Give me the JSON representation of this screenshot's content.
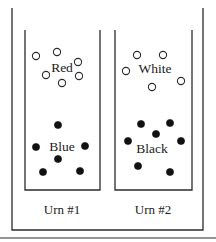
{
  "figure": {
    "outer_frame": {
      "x": 12,
      "y": 8,
      "width": 191,
      "height": 222,
      "open_top": true,
      "stroke": "#2b2b2b",
      "stroke_width": 1.3
    },
    "baseline_rule": {
      "x1": 0,
      "x2": 216,
      "y": 238,
      "stroke": "#2b2b2b",
      "stroke_width": 1.2
    },
    "urns": [
      {
        "id": "urn-1",
        "label": "Urn #1",
        "label_x": 62,
        "label_y": 214,
        "box": {
          "x": 25,
          "y": 30,
          "width": 75,
          "height": 160,
          "open_top": true
        },
        "groups": [
          {
            "id": "urn-1-red",
            "label": "Red",
            "label_x": 62,
            "label_y": 72,
            "ball_style": "open",
            "color_name": "Red",
            "count": 6,
            "balls": [
              {
                "cx": 36,
                "cy": 56,
                "r": 3.6
              },
              {
                "cx": 57,
                "cy": 52,
                "r": 3.6
              },
              {
                "cx": 78,
                "cy": 62,
                "r": 3.6
              },
              {
                "cx": 46,
                "cy": 75,
                "r": 3.6
              },
              {
                "cx": 79,
                "cy": 76,
                "r": 3.6
              },
              {
                "cx": 62,
                "cy": 83,
                "r": 3.6
              }
            ]
          },
          {
            "id": "urn-1-blue",
            "label": "Blue",
            "label_x": 62,
            "label_y": 151,
            "ball_style": "filled",
            "color_name": "Blue",
            "count": 6,
            "balls": [
              {
                "cx": 58,
                "cy": 125,
                "r": 3.6
              },
              {
                "cx": 36,
                "cy": 147,
                "r": 3.6
              },
              {
                "cx": 85,
                "cy": 146,
                "r": 3.6
              },
              {
                "cx": 58,
                "cy": 159,
                "r": 3.6
              },
              {
                "cx": 43,
                "cy": 172,
                "r": 3.6
              },
              {
                "cx": 80,
                "cy": 171,
                "r": 3.6
              }
            ]
          }
        ]
      },
      {
        "id": "urn-2",
        "label": "Urn #2",
        "label_x": 153,
        "label_y": 214,
        "box": {
          "x": 115,
          "y": 30,
          "width": 77,
          "height": 160,
          "open_top": true
        },
        "groups": [
          {
            "id": "urn-2-white",
            "label": "White",
            "label_x": 155,
            "label_y": 73,
            "ball_style": "open",
            "color_name": "White",
            "count": 5,
            "balls": [
              {
                "cx": 137,
                "cy": 55,
                "r": 3.6
              },
              {
                "cx": 163,
                "cy": 55,
                "r": 3.6
              },
              {
                "cx": 126,
                "cy": 71,
                "r": 3.6
              },
              {
                "cx": 181,
                "cy": 81,
                "r": 3.6
              },
              {
                "cx": 152,
                "cy": 87,
                "r": 3.6
              }
            ]
          },
          {
            "id": "urn-2-black",
            "label": "Black",
            "label_x": 152,
            "label_y": 153,
            "ball_style": "filled",
            "color_name": "Black",
            "count": 7,
            "balls": [
              {
                "cx": 141,
                "cy": 124,
                "r": 3.6
              },
              {
                "cx": 170,
                "cy": 123,
                "r": 3.6
              },
              {
                "cx": 156,
                "cy": 134,
                "r": 3.6
              },
              {
                "cx": 128,
                "cy": 141,
                "r": 3.6
              },
              {
                "cx": 181,
                "cy": 141,
                "r": 3.6
              },
              {
                "cx": 138,
                "cy": 166,
                "r": 3.6
              },
              {
                "cx": 170,
                "cy": 172,
                "r": 3.6
              }
            ]
          }
        ]
      }
    ],
    "colors": {
      "ink": "#2b2b2b",
      "fill_ball": "#111111",
      "open_ball": "#ffffff",
      "background": "#ffffff"
    }
  }
}
